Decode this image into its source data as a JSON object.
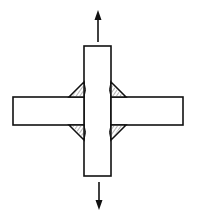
{
  "diagram": {
    "colors": {
      "stroke": "#111111",
      "background": "#ffffff",
      "weld_fill": "#ffffff",
      "weld_hatch": "#333333"
    },
    "components": {
      "vertical_plate": {
        "x": 84,
        "y": 46,
        "width": 27,
        "height": 130
      },
      "left_plate": {
        "x": 13,
        "y": 97,
        "width": 71,
        "height": 28
      },
      "right_plate": {
        "x": 111,
        "y": 97,
        "width": 72,
        "height": 28
      },
      "welds": [
        {
          "position": "top-left"
        },
        {
          "position": "top-right"
        },
        {
          "position": "bottom-left"
        },
        {
          "position": "bottom-right"
        }
      ],
      "arrows": [
        {
          "direction": "up",
          "label": ""
        },
        {
          "direction": "down",
          "label": ""
        }
      ]
    }
  }
}
